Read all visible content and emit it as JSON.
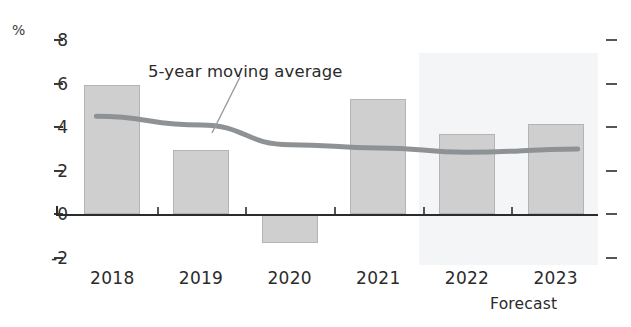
{
  "chart_data": {
    "type": "bar",
    "title": "",
    "subtitle": "",
    "xlabel": "",
    "ylabel": "%",
    "categories": [
      "2018",
      "2019",
      "2020",
      "2021",
      "2022",
      "2023"
    ],
    "values": [
      5.95,
      2.95,
      -1.3,
      5.3,
      3.7,
      4.15
    ],
    "series": [
      {
        "name": "Annual value",
        "type": "bar",
        "values": [
          5.95,
          2.95,
          -1.3,
          5.3,
          3.7,
          4.15
        ]
      },
      {
        "name": "5-year moving average",
        "type": "line",
        "x": [
          "2018",
          "2019",
          "2020",
          "2021",
          "2022",
          "2023"
        ],
        "values": [
          4.5,
          4.1,
          3.2,
          3.05,
          2.85,
          3.0
        ]
      }
    ],
    "ylim": [
      -2,
      8
    ],
    "yticks": [
      8,
      6,
      4,
      2,
      0,
      -2
    ],
    "ytick_labels": [
      "8",
      "6",
      "4",
      "2",
      "0",
      "-2"
    ],
    "grid": false,
    "legend_position": "inline-annotation",
    "annotations": [
      {
        "text": "5-year moving average",
        "target_series": "5-year moving average"
      },
      {
        "text": "Forecast",
        "note": "shaded band covering 2022 and 2023"
      }
    ],
    "forecast_band": {
      "label": "Forecast",
      "from": "2022",
      "to": "2023"
    },
    "colors": {
      "bar_fill": "#cfcfcf",
      "bar_stroke": "#b4b4b4",
      "line": "#8f9295",
      "axis": "#2b2b2b",
      "forecast_band": "#f4f5f6",
      "text": "#2b2b2b"
    }
  },
  "axis": {
    "unit_label": "%",
    "y_ticks": [
      {
        "label": "8",
        "value": 8
      },
      {
        "label": "6",
        "value": 6
      },
      {
        "label": "4",
        "value": 4
      },
      {
        "label": "2",
        "value": 2
      },
      {
        "label": "0",
        "value": 0
      },
      {
        "label": "-2",
        "value": -2
      }
    ]
  },
  "x_labels": [
    {
      "label": "2018"
    },
    {
      "label": "2019"
    },
    {
      "label": "2020"
    },
    {
      "label": "2021"
    },
    {
      "label": "2022"
    },
    {
      "label": "2023"
    }
  ],
  "annotations": {
    "moving_average_label": "5-year moving average",
    "forecast_label": "Forecast"
  }
}
